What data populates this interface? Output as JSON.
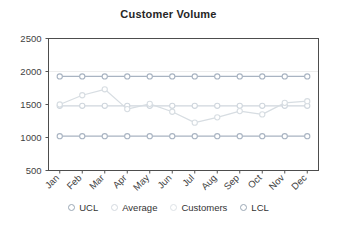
{
  "chart_data": {
    "type": "line",
    "title": "Customer Volume",
    "xlabel": "",
    "ylabel": "",
    "categories": [
      "Jan",
      "Feb",
      "Mar",
      "Apr",
      "May",
      "Jun",
      "Jul",
      "Aug",
      "Sep",
      "Oct",
      "Nov",
      "Dec"
    ],
    "ylim": [
      500,
      2500
    ],
    "yticks": [
      500,
      1000,
      1500,
      2000,
      2500
    ],
    "ytick_labels": [
      "500",
      "1000",
      "1500",
      "2000",
      "2500"
    ],
    "grid": false,
    "legend_position": "bottom",
    "series": [
      {
        "name": "UCL",
        "color": "#a9b4c2",
        "values": [
          1925,
          1925,
          1925,
          1925,
          1925,
          1925,
          1925,
          1925,
          1925,
          1925,
          1925,
          1925
        ]
      },
      {
        "name": "Average",
        "color": "#cfd6dd",
        "values": [
          1480,
          1480,
          1480,
          1480,
          1480,
          1480,
          1480,
          1480,
          1480,
          1480,
          1480,
          1480
        ]
      },
      {
        "name": "Customers",
        "color": "#d7dde2",
        "values": [
          1500,
          1640,
          1730,
          1430,
          1510,
          1390,
          1225,
          1305,
          1400,
          1350,
          1525,
          1550
        ]
      },
      {
        "name": "LCL",
        "color": "#a9b4c2",
        "values": [
          1020,
          1020,
          1020,
          1020,
          1020,
          1020,
          1020,
          1020,
          1020,
          1020,
          1020,
          1020
        ]
      }
    ],
    "annotations": []
  },
  "legend": {
    "items": [
      {
        "label": "UCL",
        "color": "#9aa7b5"
      },
      {
        "label": "Average",
        "color": "#d3d9df"
      },
      {
        "label": "Customers",
        "color": "#dde2e6"
      },
      {
        "label": "LCL",
        "color": "#9aa7b5"
      }
    ]
  },
  "colors": {
    "axis": "#555555",
    "plot_border": "#4d4d4d",
    "gridline": "#ededed",
    "title": "#262626",
    "background": "#ffffff"
  }
}
